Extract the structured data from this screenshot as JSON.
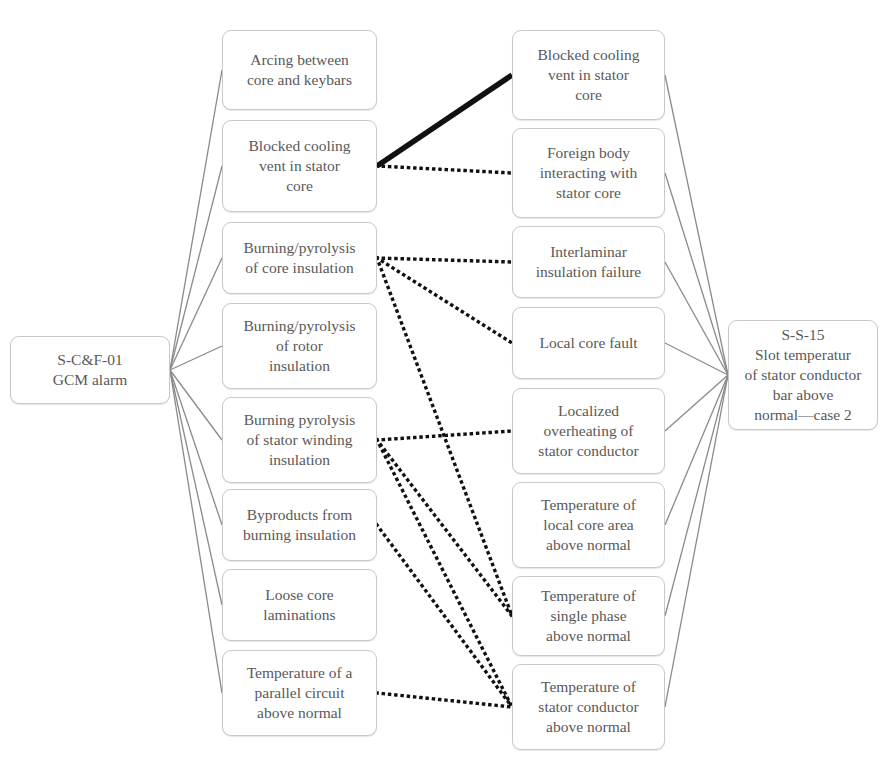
{
  "diagram": {
    "type": "cause-effect-network",
    "colors": {
      "node_border": "#c9c9c9",
      "node_fill": "#ffffff",
      "node_text": "#595959",
      "solid_edge": "#8a8a8a",
      "highlight_edge": "#111111",
      "dotted_edge": "#111111"
    }
  },
  "source": {
    "id": "src",
    "label": "S-C&F-01\nGCM alarm"
  },
  "target": {
    "id": "tgt",
    "label": "S-S-15\nSlot temperatur\nof stator conductor\nbar above\nnormal—case 2"
  },
  "left_column": [
    {
      "id": "L1",
      "label": "Arcing between\ncore and keybars"
    },
    {
      "id": "L2",
      "label": "Blocked cooling\nvent in stator\ncore"
    },
    {
      "id": "L3",
      "label": "Burning/pyrolysis\nof core insulation"
    },
    {
      "id": "L4",
      "label": "Burning/pyrolysis\nof rotor\ninsulation"
    },
    {
      "id": "L5",
      "label": "Burning pyrolysis\nof stator winding\ninsulation"
    },
    {
      "id": "L6",
      "label": "Byproducts from\nburning insulation"
    },
    {
      "id": "L7",
      "label": "Loose core\nlaminations"
    },
    {
      "id": "L8",
      "label": "Temperature of a\nparallel circuit\nabove normal"
    }
  ],
  "middle_column": [
    {
      "id": "M1",
      "label": "Blocked cooling\nvent in stator\ncore"
    },
    {
      "id": "M2",
      "label": "Foreign body\ninteracting with\nstator core"
    },
    {
      "id": "M3",
      "label": "Interlaminar\ninsulation failure"
    },
    {
      "id": "M4",
      "label": "Local core fault"
    },
    {
      "id": "M5",
      "label": "Localized\noverheating of\nstator conductor"
    },
    {
      "id": "M6",
      "label": "Temperature of\nlocal core area\nabove normal"
    },
    {
      "id": "M7",
      "label": "Temperature of\nsingle phase\nabove normal"
    },
    {
      "id": "M8",
      "label": "Temperature of\nstator conductor\nabove normal"
    }
  ],
  "edges": {
    "source_to_left": [
      "L1",
      "L2",
      "L3",
      "L4",
      "L5",
      "L6",
      "L7",
      "L8"
    ],
    "middle_to_target": [
      "M1",
      "M2",
      "M3",
      "M4",
      "M5",
      "M6",
      "M7",
      "M8"
    ],
    "highlighted": [
      {
        "from": "L2",
        "to": "M1"
      }
    ],
    "dotted": [
      {
        "from": "L2",
        "to": "M2"
      },
      {
        "from": "L3",
        "to": "M3"
      },
      {
        "from": "L3",
        "to": "M4"
      },
      {
        "from": "L3",
        "to": "M7"
      },
      {
        "from": "L5",
        "to": "M5"
      },
      {
        "from": "L5",
        "to": "M7"
      },
      {
        "from": "L5",
        "to": "M8"
      },
      {
        "from": "L6",
        "to": "M8"
      },
      {
        "from": "L8",
        "to": "M8"
      }
    ]
  }
}
